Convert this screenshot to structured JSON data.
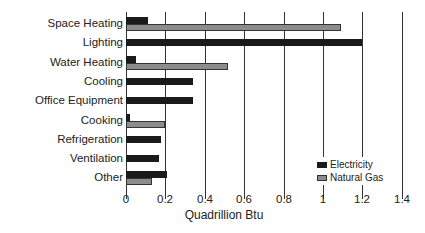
{
  "chart_data": {
    "type": "bar",
    "orientation": "horizontal",
    "title": "",
    "xlabel": "Quadrillion Btu",
    "ylabel": "",
    "xlim": [
      0,
      1.4
    ],
    "xticks": [
      "0",
      "0.2",
      "0.4",
      "0.6",
      "0.8",
      "1",
      "1.2",
      "1.4"
    ],
    "grid": true,
    "legend_position": "lower right",
    "categories": [
      "Space Heating",
      "Lighting",
      "Water Heating",
      "Cooling",
      "Office Equipment",
      "Cooking",
      "Refrigeration",
      "Ventilation",
      "Other"
    ],
    "series": [
      {
        "name": "Electricity",
        "color": "#1a1a1a",
        "values": [
          0.11,
          1.2,
          0.05,
          0.34,
          0.34,
          0.02,
          0.18,
          0.17,
          0.21
        ]
      },
      {
        "name": "Natural Gas",
        "color": "#8c8c8c",
        "values": [
          1.09,
          0,
          0.52,
          0,
          0,
          0.2,
          0,
          0,
          0.13
        ]
      }
    ]
  },
  "legend": {
    "electricity": "Electricity",
    "natural_gas": "Natural Gas"
  }
}
